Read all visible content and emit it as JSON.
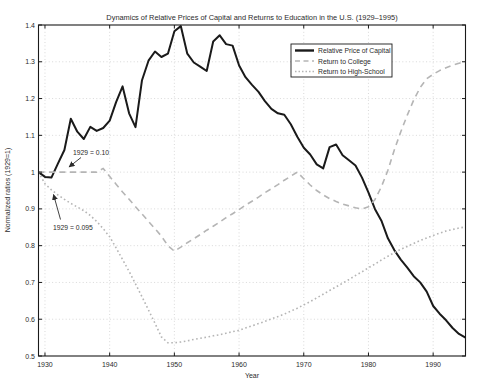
{
  "chart_data": {
    "type": "line",
    "title": "Dynamics of Relative Prices of Capital and Returns to Education in the U.S. (1929–1995)",
    "xlabel": "Year",
    "ylabel": "Normalized ratios (1929=1)",
    "xlim": [
      1929,
      1995
    ],
    "ylim": [
      0.5,
      1.4
    ],
    "grid": true,
    "legend_position": "upper-right-inside",
    "x_ticks": [
      1930,
      1940,
      1950,
      1960,
      1970,
      1980,
      1990
    ],
    "x_tick_labels": [
      "1930",
      "1940",
      "1950",
      "1960",
      "1970",
      "1980",
      "1990"
    ],
    "y_ticks": [
      0.5,
      0.6,
      0.7,
      0.8,
      0.9,
      1,
      1.1,
      1.2,
      1.3,
      1.4
    ],
    "y_tick_labels": [
      "0.5",
      "0.6",
      "0.7",
      "0.8",
      "0.9",
      "1",
      "1.1",
      "1.2",
      "1.3",
      "1.4"
    ],
    "colors": {
      "capital": "#1a1a1a",
      "education": "#b5b5b5",
      "grid": "#cfcfcf"
    },
    "x_years": [
      1929,
      1930,
      1931,
      1932,
      1933,
      1934,
      1935,
      1936,
      1937,
      1938,
      1939,
      1940,
      1941,
      1942,
      1943,
      1944,
      1945,
      1946,
      1947,
      1948,
      1949,
      1950,
      1951,
      1952,
      1953,
      1954,
      1955,
      1956,
      1957,
      1958,
      1959,
      1960,
      1961,
      1962,
      1963,
      1964,
      1965,
      1966,
      1967,
      1968,
      1969,
      1970,
      1971,
      1972,
      1973,
      1974,
      1975,
      1976,
      1977,
      1978,
      1979,
      1980,
      1981,
      1982,
      1983,
      1984,
      1985,
      1986,
      1987,
      1988,
      1989,
      1990,
      1991,
      1992,
      1993,
      1994,
      1995
    ],
    "series": [
      {
        "name": "Relative Price of Capital",
        "style": "solid",
        "color": "#1a1a1a",
        "width": 2,
        "values": [
          1.0,
          0.987,
          0.985,
          1.023,
          1.06,
          1.145,
          1.11,
          1.09,
          1.123,
          1.112,
          1.12,
          1.14,
          1.19,
          1.233,
          1.16,
          1.122,
          1.25,
          1.303,
          1.328,
          1.313,
          1.322,
          1.383,
          1.397,
          1.322,
          1.298,
          1.287,
          1.275,
          1.355,
          1.372,
          1.348,
          1.344,
          1.29,
          1.258,
          1.237,
          1.218,
          1.193,
          1.172,
          1.16,
          1.156,
          1.13,
          1.096,
          1.066,
          1.048,
          1.021,
          1.01,
          1.068,
          1.075,
          1.046,
          1.032,
          1.018,
          0.985,
          0.944,
          0.9,
          0.868,
          0.82,
          0.788,
          0.762,
          0.74,
          0.717,
          0.7,
          0.675,
          0.636,
          0.615,
          0.597,
          0.576,
          0.56,
          0.55
        ]
      },
      {
        "name": "Return to College",
        "style": "dashed",
        "color": "#b5b5b5",
        "width": 1.6,
        "values": [
          1.0,
          1.0,
          1.0,
          1.0,
          1.0,
          1.0,
          1.0,
          1.0,
          1.0,
          1.0,
          1.01,
          0.988,
          0.967,
          0.946,
          0.926,
          0.906,
          0.886,
          0.866,
          0.846,
          0.826,
          0.8,
          0.785,
          0.796,
          0.808,
          0.819,
          0.83,
          0.842,
          0.853,
          0.864,
          0.876,
          0.887,
          0.898,
          0.91,
          0.921,
          0.932,
          0.944,
          0.955,
          0.966,
          0.978,
          0.989,
          1.0,
          0.982,
          0.965,
          0.95,
          0.938,
          0.928,
          0.92,
          0.913,
          0.908,
          0.903,
          0.9,
          0.906,
          0.925,
          0.96,
          1.005,
          1.06,
          1.11,
          1.155,
          1.196,
          1.23,
          1.254,
          1.266,
          1.276,
          1.284,
          1.291,
          1.296,
          1.3
        ]
      },
      {
        "name": "Return to High-School",
        "style": "dotted",
        "color": "#b5b5b5",
        "width": 1.6,
        "values": [
          1.0,
          0.968,
          0.952,
          0.938,
          0.926,
          0.915,
          0.905,
          0.895,
          0.882,
          0.866,
          0.846,
          0.824,
          0.794,
          0.762,
          0.73,
          0.696,
          0.661,
          0.625,
          0.589,
          0.552,
          0.536,
          0.536,
          0.538,
          0.541,
          0.545,
          0.548,
          0.551,
          0.555,
          0.558,
          0.562,
          0.566,
          0.57,
          0.576,
          0.582,
          0.588,
          0.594,
          0.601,
          0.607,
          0.614,
          0.622,
          0.63,
          0.639,
          0.648,
          0.658,
          0.668,
          0.678,
          0.688,
          0.698,
          0.708,
          0.719,
          0.729,
          0.74,
          0.75,
          0.761,
          0.771,
          0.781,
          0.79,
          0.798,
          0.806,
          0.814,
          0.821,
          0.828,
          0.834,
          0.84,
          0.844,
          0.848,
          0.851
        ]
      }
    ],
    "annotations": [
      {
        "text": "1929 = 0.10",
        "points_to": "Return to College at 1929 level"
      },
      {
        "text": "1929 = 0.095",
        "points_to": "Return to High-School at 1929 level"
      }
    ]
  }
}
